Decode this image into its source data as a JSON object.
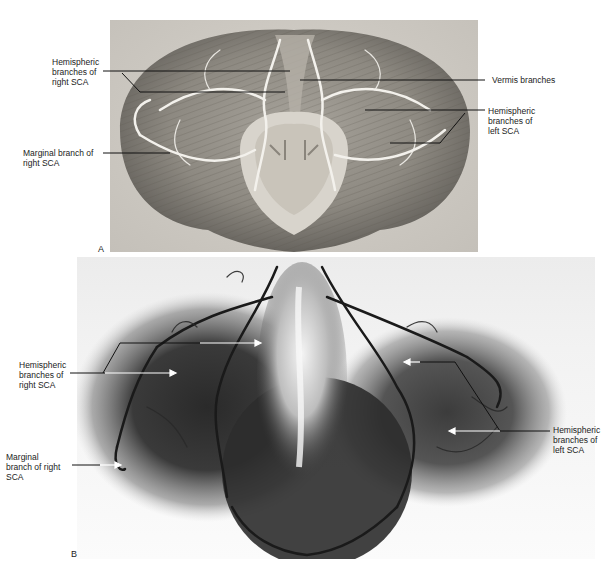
{
  "figure": {
    "panels": [
      {
        "letter": "A",
        "type": "photograph",
        "subject": "cerebellum superior view with arteries",
        "labels": [
          {
            "text": "Hemispheric\nbranches of\nright SCA",
            "side": "left"
          },
          {
            "text": "Marginal branch of\nright SCA",
            "side": "left"
          },
          {
            "text": "Vermis branches",
            "side": "right"
          },
          {
            "text": "Hemispheric\nbranches of\nleft SCA",
            "side": "right"
          }
        ]
      },
      {
        "letter": "B",
        "type": "angiogram",
        "subject": "cerebellar arteries angiogram",
        "labels": [
          {
            "text": "Hemispheric\nbranches of\nright SCA",
            "side": "left"
          },
          {
            "text": "Marginal\nbranch of right\nSCA",
            "side": "left"
          },
          {
            "text": "Hemispheric\nbranches of\nleft SCA",
            "side": "right"
          }
        ]
      }
    ]
  },
  "colors": {
    "background": "#ffffff",
    "label_text": "#222222",
    "leader_line": "#111111",
    "arrow_white": "#ffffff"
  }
}
